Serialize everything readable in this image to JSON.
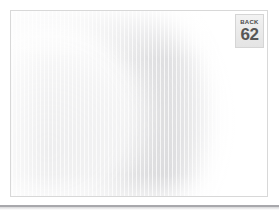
{
  "viewer": {
    "page_background": "#ffffff"
  },
  "scan_card": {
    "name": "scanned-page",
    "border_color": "#d8d8d8",
    "background": "#ffffff",
    "overlay_description": "faint washed-out gray arc with vertical scan striping"
  },
  "page_badge": {
    "label": "BACK",
    "number": "62",
    "background": "#eaeaea",
    "border_color": "#d5d5d5",
    "label_color": "#4a4a4a",
    "number_color": "#565656"
  },
  "bottom_bar": {
    "color": "#a8a8ac"
  }
}
